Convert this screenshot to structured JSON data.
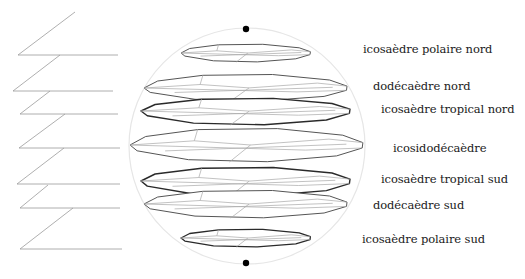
{
  "diagram": {
    "type": "polyhedra-slices-in-sphere",
    "sphere": {
      "cx": 247,
      "cy": 146,
      "r": 118,
      "stroke": "#e6e6e6"
    },
    "poles": {
      "north": {
        "cx": 246,
        "cy": 29,
        "r": 3.2
      },
      "south": {
        "cx": 246,
        "cy": 263,
        "r": 3.2
      }
    },
    "layers": [
      {
        "id": "icosaedre-polaire-nord",
        "label": "icosaèdre polaire nord",
        "label_x": 363,
        "label_y": 44,
        "cx": 246,
        "cy": 53,
        "rx": 65,
        "top": 44,
        "bottom": 62,
        "stroke": "#555555",
        "weight": 1.0
      },
      {
        "id": "dodecaedre-nord",
        "label": "dodécaèdre nord",
        "label_x": 373,
        "label_y": 81,
        "cx": 246,
        "cy": 88,
        "rx": 102,
        "top": 74,
        "bottom": 101,
        "stroke": "#555555",
        "weight": 1.0
      },
      {
        "id": "icosaedre-tropical-nord",
        "label": "icosaèdre tropical nord",
        "label_x": 381,
        "label_y": 104,
        "cx": 246,
        "cy": 111,
        "rx": 105,
        "top": 98,
        "bottom": 125,
        "stroke": "#2a2a2a",
        "weight": 1.4
      },
      {
        "id": "icosidodecaedre",
        "label": "icosidodécaèdre",
        "label_x": 393,
        "label_y": 143,
        "cx": 247,
        "cy": 145,
        "rx": 117,
        "top": 128,
        "bottom": 162,
        "stroke": "#555555",
        "weight": 1.0
      },
      {
        "id": "icosaedre-tropical-sud",
        "label": "icosaèdre tropical sud",
        "label_x": 381,
        "label_y": 174,
        "cx": 246,
        "cy": 181,
        "rx": 105,
        "top": 167,
        "bottom": 196,
        "stroke": "#2a2a2a",
        "weight": 1.4
      },
      {
        "id": "dodecaedre-sud",
        "label": "dodécaèdre sud",
        "label_x": 373,
        "label_y": 200,
        "cx": 246,
        "cy": 204,
        "rx": 102,
        "top": 190,
        "bottom": 218,
        "stroke": "#555555",
        "weight": 1.0
      },
      {
        "id": "icosaedre-polaire-sud",
        "label": "icosaèdre polaire sud",
        "label_x": 362,
        "label_y": 234,
        "cx": 246,
        "cy": 238,
        "rx": 65,
        "top": 229,
        "bottom": 247,
        "stroke": "#2a2a2a",
        "weight": 1.3
      }
    ],
    "profile_lines": [
      {
        "diag": [
          75,
          12,
          18,
          55
        ],
        "horiz": [
          18,
          55,
          118,
          55
        ]
      },
      {
        "diag": [
          60,
          55,
          13,
          91
        ],
        "horiz": [
          13,
          91,
          113,
          91
        ]
      },
      {
        "diag": [
          50,
          91,
          20,
          114
        ],
        "horiz": [
          20,
          114,
          118,
          114
        ]
      },
      {
        "diag": [
          65,
          114,
          19,
          148
        ],
        "horiz": [
          19,
          148,
          120,
          148
        ]
      },
      {
        "diag": [
          64,
          148,
          17,
          184
        ],
        "horiz": [
          17,
          184,
          120,
          184
        ]
      },
      {
        "diag": [
          48,
          185,
          20,
          208
        ],
        "horiz": [
          20,
          208,
          120,
          208
        ]
      },
      {
        "diag": [
          73,
          208,
          20,
          249
        ],
        "horiz": [
          20,
          249,
          122,
          249
        ]
      }
    ],
    "colors": {
      "profile_line": "#9a9a9a",
      "inner_edge": "#a8a8a8",
      "pole": "#000000",
      "text": "#1a1a1a"
    }
  }
}
